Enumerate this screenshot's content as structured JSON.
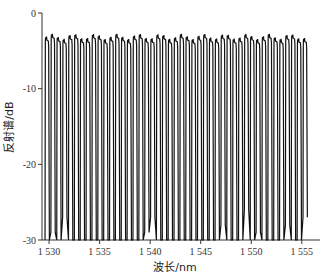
{
  "chart_data": {
    "type": "line",
    "title": "",
    "xlabel": "波长/nm",
    "ylabel": "反射谱/dB",
    "xlim": [
      1529.3,
      1556.8
    ],
    "ylim": [
      -30,
      0
    ],
    "xticks": [
      1530,
      1535,
      1540,
      1545,
      1550,
      1555
    ],
    "xtick_labels": [
      "1 530",
      "1 535",
      "1 540",
      "1 545",
      "1 550",
      "1 555"
    ],
    "yticks": [
      0,
      -10,
      -20,
      -30
    ],
    "ytick_labels": [
      "0",
      "-10",
      "-20",
      "-30"
    ],
    "grid": false,
    "legend": null,
    "series": [
      {
        "name": "反射谱",
        "description": "comb-like reflection spectrum with ~45 channels, peaks near -3 dB, dips to -30 dB",
        "channel_count": 45,
        "channel_spacing_nm": 0.58,
        "start_nm": 1529.6,
        "peak_level_db": -3.2,
        "dip_levels_db": [
          -30,
          -29,
          -30,
          -27,
          -30,
          -30,
          -30,
          -30,
          -30,
          -30,
          -30,
          -30,
          -30,
          -30,
          -30,
          -30,
          -30,
          -29,
          -27,
          -30,
          -30,
          -30,
          -30,
          -30,
          -30,
          -30,
          -30,
          -30,
          -30,
          -30,
          -28,
          -30,
          -30,
          -30,
          -26,
          -30,
          -29,
          -30,
          -30,
          -30,
          -30,
          -28,
          -30,
          -30,
          -27
        ]
      }
    ]
  }
}
